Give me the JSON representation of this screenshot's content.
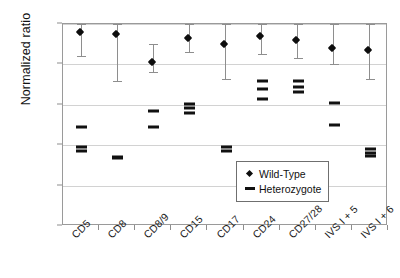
{
  "chart_data": {
    "type": "scatter",
    "title": "",
    "xlabel": "",
    "ylabel": "Normalized ratio",
    "ylim": [
      0.0,
      1.0
    ],
    "ytick_labels": [
      "0,00",
      "0,20",
      "0,40",
      "0,60",
      "0,80",
      "1,00"
    ],
    "ytick_values": [
      0.0,
      0.2,
      0.4,
      0.6,
      0.8,
      1.0
    ],
    "grid": true,
    "legend_position": "lower-right",
    "decimal_separator": ",",
    "categories": [
      "CD5",
      "CD8",
      "CD8/9",
      "CD15",
      "CD17",
      "CD24",
      "CD27/28",
      "IVS I + 5",
      "IVS I + 6"
    ],
    "legend": [
      {
        "name": "Wild-Type",
        "marker": "diamond"
      },
      {
        "name": "Heterozygote",
        "marker": "dash"
      }
    ],
    "series": [
      {
        "name": "Wild-Type",
        "marker": "diamond",
        "values": [
          0.96,
          0.95,
          0.81,
          0.93,
          0.9,
          0.94,
          0.92,
          0.88,
          0.87
        ],
        "err_low": [
          0.84,
          0.72,
          0.76,
          0.86,
          0.73,
          0.85,
          0.83,
          0.8,
          0.73
        ],
        "err_high": [
          1.0,
          1.0,
          0.9,
          1.0,
          1.0,
          1.0,
          1.0,
          1.0,
          1.0
        ]
      },
      {
        "name": "Heterozygote",
        "marker": "dash",
        "points": [
          [
            0.49,
            0.39,
            0.37
          ],
          [
            0.34,
            0.335
          ],
          [
            0.57,
            0.49
          ],
          [
            0.605,
            0.585,
            0.56
          ],
          [
            0.39,
            0.37
          ],
          [
            0.72,
            0.68,
            0.63
          ],
          [
            0.72,
            0.69,
            0.665
          ],
          [
            0.61,
            0.5
          ],
          [
            0.38,
            0.36,
            0.345
          ]
        ]
      }
    ]
  }
}
